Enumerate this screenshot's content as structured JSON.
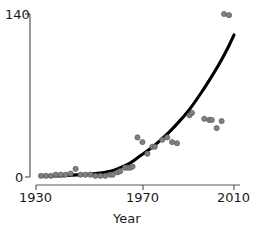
{
  "chart_data": {
    "type": "scatter",
    "title": "",
    "subtitle": "",
    "xlabel": "Year",
    "ylabel": "",
    "xlim": [
      1930,
      2012
    ],
    "ylim": [
      0,
      142
    ],
    "xticks": [
      1930,
      1970,
      2010
    ],
    "xticklabels": [
      "1930",
      "1970",
      "2010"
    ],
    "yticks": [
      0,
      140
    ],
    "yticklabels": [
      "0",
      "140"
    ],
    "grid": false,
    "legend": null,
    "annotations": [],
    "series": [
      {
        "name": "observations",
        "type": "scatter",
        "marker": "circle",
        "color": "#808080",
        "points": [
          {
            "x": 1932,
            "y": 1
          },
          {
            "x": 1934,
            "y": 1
          },
          {
            "x": 1936,
            "y": 1
          },
          {
            "x": 1938,
            "y": 2
          },
          {
            "x": 1940,
            "y": 2
          },
          {
            "x": 1942,
            "y": 2
          },
          {
            "x": 1944,
            "y": 3
          },
          {
            "x": 1946,
            "y": 7
          },
          {
            "x": 1948,
            "y": 2
          },
          {
            "x": 1950,
            "y": 2
          },
          {
            "x": 1952,
            "y": 2
          },
          {
            "x": 1954,
            "y": 1
          },
          {
            "x": 1956,
            "y": 1
          },
          {
            "x": 1958,
            "y": 1
          },
          {
            "x": 1960,
            "y": 2
          },
          {
            "x": 1961,
            "y": 2
          },
          {
            "x": 1963,
            "y": 4
          },
          {
            "x": 1964,
            "y": 5
          },
          {
            "x": 1966,
            "y": 8
          },
          {
            "x": 1967,
            "y": 8
          },
          {
            "x": 1968,
            "y": 8
          },
          {
            "x": 1969,
            "y": 9
          },
          {
            "x": 1971,
            "y": 34
          },
          {
            "x": 1973,
            "y": 30
          },
          {
            "x": 1975,
            "y": 20
          },
          {
            "x": 1977,
            "y": 26
          },
          {
            "x": 1978,
            "y": 26
          },
          {
            "x": 1981,
            "y": 32
          },
          {
            "x": 1983,
            "y": 34
          },
          {
            "x": 1985,
            "y": 30
          },
          {
            "x": 1987,
            "y": 29
          },
          {
            "x": 1992,
            "y": 53
          },
          {
            "x": 1993,
            "y": 55
          },
          {
            "x": 1998,
            "y": 50
          },
          {
            "x": 2000,
            "y": 49
          },
          {
            "x": 2001,
            "y": 49
          },
          {
            "x": 2003,
            "y": 42
          },
          {
            "x": 2005,
            "y": 48
          },
          {
            "x": 2006,
            "y": 140
          },
          {
            "x": 2008,
            "y": 139
          }
        ]
      },
      {
        "name": "fitted-trend",
        "type": "line",
        "color": "#000000",
        "points": [
          {
            "x": 1932,
            "y": 1
          },
          {
            "x": 1940,
            "y": 1
          },
          {
            "x": 1948,
            "y": 2
          },
          {
            "x": 1954,
            "y": 3
          },
          {
            "x": 1960,
            "y": 5
          },
          {
            "x": 1964,
            "y": 8
          },
          {
            "x": 1968,
            "y": 12
          },
          {
            "x": 1972,
            "y": 18
          },
          {
            "x": 1976,
            "y": 24
          },
          {
            "x": 1980,
            "y": 31
          },
          {
            "x": 1984,
            "y": 39
          },
          {
            "x": 1988,
            "y": 48
          },
          {
            "x": 1992,
            "y": 58
          },
          {
            "x": 1996,
            "y": 70
          },
          {
            "x": 2000,
            "y": 83
          },
          {
            "x": 2004,
            "y": 97
          },
          {
            "x": 2008,
            "y": 113
          },
          {
            "x": 2010,
            "y": 122
          }
        ]
      }
    ]
  },
  "axes": {
    "y_top_label": "140",
    "y_bottom_label": "0",
    "x_left_label": "1930",
    "x_mid_label": "1970",
    "x_right_label": "2010",
    "x_title": "Year"
  },
  "colors": {
    "marker": "#808080",
    "marker_edge": "#5a5a5a",
    "trend_line": "#000000",
    "axis": "#595959",
    "text": "#1a1a1a",
    "background": "#ffffff"
  }
}
